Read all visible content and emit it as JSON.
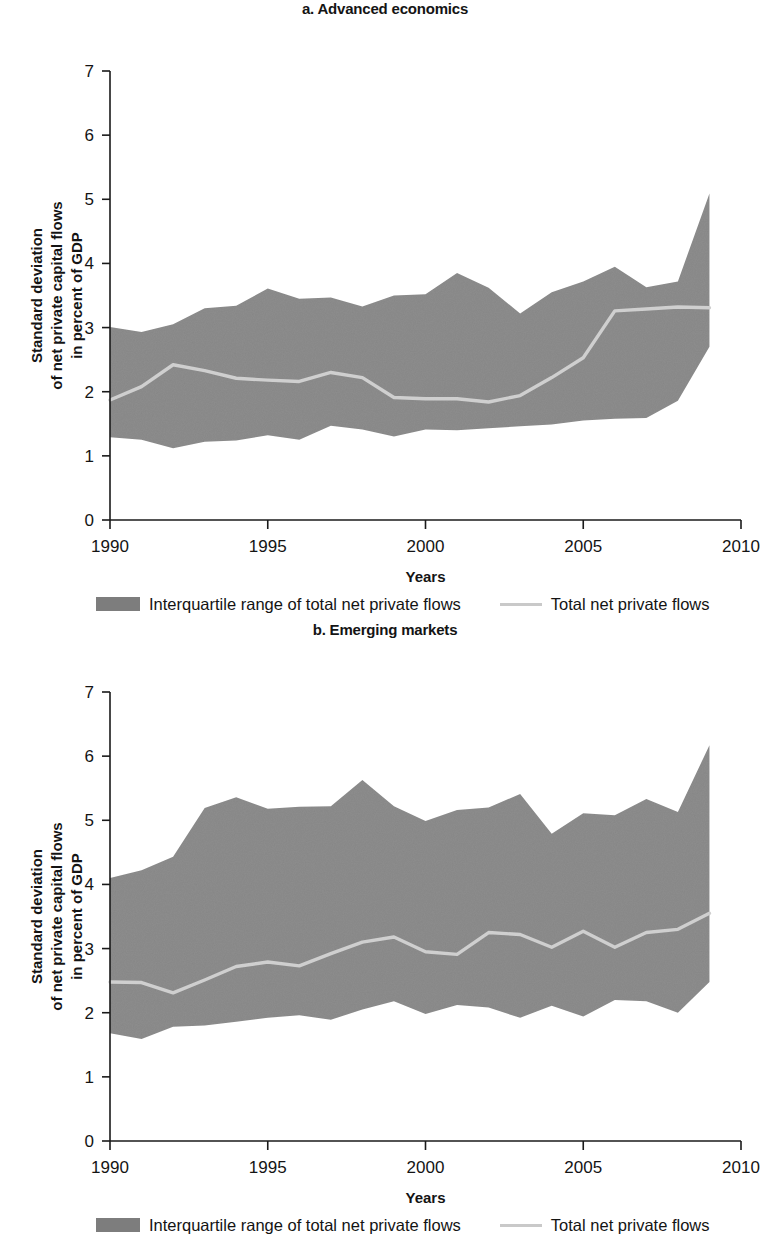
{
  "figure": {
    "ylabel_lines": [
      "Standard deviation",
      "of net private capital flows",
      "in percent of GDP"
    ],
    "xlabel": "Years",
    "legend": {
      "band_label": "Interquartile range of total net private flows",
      "line_label": "Total net private flows"
    },
    "colors": {
      "band": "#7d7d7d",
      "line": "#cfcfcf",
      "axis": "#1a1a1a",
      "text": "#141414"
    }
  },
  "chart_data": [
    {
      "type": "area",
      "title": "a. Advanced economics",
      "xlabel": "Years",
      "ylabel": "Standard deviation of net private capital flows in percent of GDP",
      "xlim": [
        1990,
        2010
      ],
      "ylim": [
        0,
        7
      ],
      "xticks": [
        1990,
        1995,
        2000,
        2005,
        2010
      ],
      "yticks": [
        0,
        1,
        2,
        3,
        4,
        5,
        6,
        7
      ],
      "grid": false,
      "legend_position": "below",
      "x": [
        1990,
        1991,
        1992,
        1993,
        1994,
        1995,
        1996,
        1997,
        1998,
        1999,
        2000,
        2001,
        2002,
        2003,
        2004,
        2005,
        2006,
        2007,
        2008,
        2009
      ],
      "series": [
        {
          "name": "Interquartile range of total net private flows (upper)",
          "values": [
            3.01,
            2.93,
            3.05,
            3.3,
            3.34,
            3.61,
            3.45,
            3.47,
            3.33,
            3.5,
            3.52,
            3.85,
            3.62,
            3.22,
            3.55,
            3.72,
            3.95,
            3.63,
            3.72,
            5.09
          ]
        },
        {
          "name": "Interquartile range of total net private flows (lower)",
          "values": [
            1.29,
            1.25,
            1.12,
            1.22,
            1.24,
            1.32,
            1.25,
            1.47,
            1.41,
            1.3,
            1.41,
            1.4,
            1.43,
            1.46,
            1.49,
            1.55,
            1.58,
            1.59,
            1.86,
            2.7
          ]
        },
        {
          "name": "Total net private flows",
          "values": [
            1.87,
            2.08,
            2.42,
            2.33,
            2.21,
            2.18,
            2.16,
            2.3,
            2.22,
            1.91,
            1.89,
            1.89,
            1.84,
            1.94,
            2.22,
            2.53,
            3.26,
            3.29,
            3.32,
            3.31
          ]
        }
      ]
    },
    {
      "type": "area",
      "title": "b. Emerging markets",
      "xlabel": "Years",
      "ylabel": "Standard deviation of net private capital flows in percent of GDP",
      "xlim": [
        1990,
        2010
      ],
      "ylim": [
        0,
        7
      ],
      "xticks": [
        1990,
        1995,
        2000,
        2005,
        2010
      ],
      "yticks": [
        0,
        1,
        2,
        3,
        4,
        5,
        6,
        7
      ],
      "grid": false,
      "legend_position": "below",
      "x": [
        1990,
        1991,
        1992,
        1993,
        1994,
        1995,
        1996,
        1997,
        1998,
        1999,
        2000,
        2001,
        2002,
        2003,
        2004,
        2005,
        2006,
        2007,
        2008,
        2009
      ],
      "series": [
        {
          "name": "Interquartile range of total net private flows (upper)",
          "values": [
            4.1,
            4.22,
            4.43,
            5.19,
            5.36,
            5.18,
            5.21,
            5.22,
            5.63,
            5.22,
            4.99,
            5.16,
            5.2,
            5.41,
            4.79,
            5.11,
            5.08,
            5.33,
            5.13,
            6.17
          ]
        },
        {
          "name": "Interquartile range of total net private flows (lower)",
          "values": [
            1.68,
            1.59,
            1.78,
            1.8,
            1.86,
            1.92,
            1.96,
            1.89,
            2.05,
            2.18,
            1.98,
            2.12,
            2.08,
            1.92,
            2.11,
            1.94,
            2.2,
            2.18,
            2.0,
            2.48
          ]
        },
        {
          "name": "Total net private flows",
          "values": [
            2.48,
            2.47,
            2.31,
            2.51,
            2.72,
            2.79,
            2.73,
            2.92,
            3.1,
            3.18,
            2.95,
            2.91,
            3.25,
            3.22,
            3.02,
            3.27,
            3.02,
            3.25,
            3.3,
            3.55
          ]
        }
      ]
    }
  ]
}
